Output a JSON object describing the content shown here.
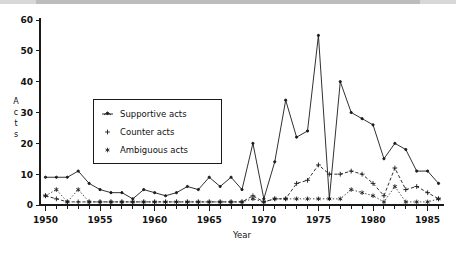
{
  "chart_data": {
    "type": "line",
    "title": "",
    "xlabel": "Year",
    "ylabel": "Acts",
    "xlim": [
      1949.5,
      1986.5
    ],
    "ylim": [
      0,
      60
    ],
    "yticks": [
      0,
      10,
      20,
      30,
      40,
      50,
      60
    ],
    "xticks": [
      1950,
      1955,
      1960,
      1965,
      1970,
      1975,
      1980,
      1985
    ],
    "xtick_labels": [
      "1950",
      "1955",
      "1960",
      "1965",
      "1970",
      "1975",
      "1980",
      "1985"
    ],
    "ytick_labels": [
      "0",
      "10",
      "20",
      "30",
      "40",
      "50",
      "60"
    ],
    "minor_xticks_every": 1,
    "grid": false,
    "legend_position": "upper-left-inside",
    "x": [
      1950,
      1951,
      1952,
      1953,
      1954,
      1955,
      1956,
      1957,
      1958,
      1959,
      1960,
      1961,
      1962,
      1963,
      1964,
      1965,
      1966,
      1967,
      1968,
      1969,
      1970,
      1971,
      1972,
      1973,
      1974,
      1975,
      1976,
      1977,
      1978,
      1979,
      1980,
      1981,
      1982,
      1983,
      1984,
      1985,
      1986
    ],
    "series": [
      {
        "name": "Supportive acts",
        "marker": "dot",
        "linestyle": "solid",
        "values": [
          9,
          9,
          9,
          11,
          7,
          5,
          4,
          4,
          2,
          5,
          4,
          3,
          4,
          6,
          5,
          9,
          6,
          9,
          5,
          20,
          2,
          14,
          34,
          22,
          24,
          55,
          2,
          40,
          30,
          28,
          26,
          15,
          20,
          18,
          11,
          11,
          7
        ]
      },
      {
        "name": "Counter acts",
        "marker": "plus",
        "linestyle": "dashed",
        "values": [
          3,
          2,
          1,
          1,
          1,
          1,
          1,
          1,
          1,
          1,
          1,
          1,
          1,
          1,
          1,
          1,
          1,
          1,
          1,
          3,
          1,
          2,
          2,
          7,
          8,
          13,
          10,
          10,
          11,
          10,
          7,
          3,
          12,
          5,
          6,
          4,
          2
        ]
      },
      {
        "name": "Ambiguous acts",
        "marker": "asterisk",
        "linestyle": "dotted",
        "values": [
          3,
          5,
          1,
          5,
          1,
          1,
          1,
          1,
          1,
          1,
          1,
          1,
          1,
          1,
          1,
          1,
          1,
          1,
          1,
          2,
          1,
          2,
          2,
          2,
          2,
          2,
          2,
          2,
          5,
          4,
          3,
          1,
          6,
          1,
          1,
          1,
          2
        ]
      }
    ]
  },
  "legend": {
    "items": [
      {
        "label": "Supportive acts",
        "marker": "dot"
      },
      {
        "label": "Counter acts",
        "marker": "plus"
      },
      {
        "label": "Ambiguous acts",
        "marker": "asterisk"
      }
    ]
  },
  "axes": {
    "y_axis_label_chars": [
      "A",
      "c",
      "t",
      "s"
    ],
    "x_axis_label": "Year"
  },
  "colors": {
    "ink": "#1a1a1a",
    "background": "#ffffff",
    "topbar": "#d8d8d8"
  }
}
